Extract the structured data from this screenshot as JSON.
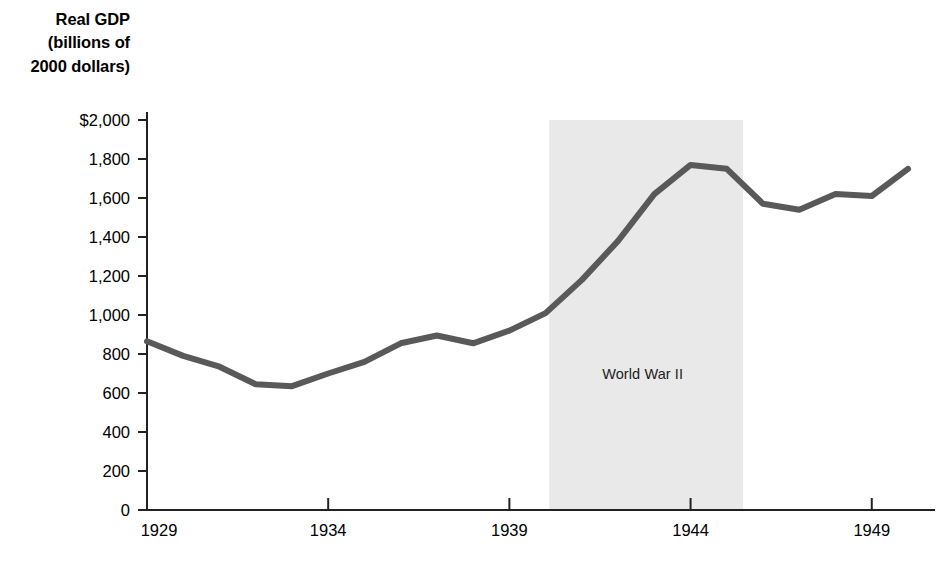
{
  "chart_data": {
    "type": "line",
    "title": "Real GDP\n(billions of\n2000 dollars)",
    "title_lines": [
      "Real GDP",
      "(billions of",
      "2000 dollars)"
    ],
    "xlabel": "",
    "ylabel": "Real GDP (billions of 2000 dollars)",
    "xlim": [
      1929,
      1950
    ],
    "ylim": [
      0,
      2000
    ],
    "grid": false,
    "legend": "none",
    "line_color": "#595959",
    "shaded_region": {
      "label": "World War II",
      "start": 1940.1,
      "end": 1945.45,
      "color": "#e9e9e9"
    },
    "y_ticks": [
      {
        "value": 2000,
        "label": "$2,000"
      },
      {
        "value": 1800,
        "label": "1,800"
      },
      {
        "value": 1600,
        "label": "1,600"
      },
      {
        "value": 1400,
        "label": "1,400"
      },
      {
        "value": 1200,
        "label": "1,200"
      },
      {
        "value": 1000,
        "label": "1,000"
      },
      {
        "value": 800,
        "label": "800"
      },
      {
        "value": 600,
        "label": "600"
      },
      {
        "value": 400,
        "label": "400"
      },
      {
        "value": 200,
        "label": "200"
      },
      {
        "value": 0,
        "label": "0"
      }
    ],
    "x_ticks": [
      {
        "value": 1929,
        "label": "1929"
      },
      {
        "value": 1934,
        "label": "1934"
      },
      {
        "value": 1939,
        "label": "1939"
      },
      {
        "value": 1944,
        "label": "1944"
      },
      {
        "value": 1949,
        "label": "1949"
      }
    ],
    "x": [
      1929,
      1930,
      1931,
      1932,
      1933,
      1934,
      1935,
      1936,
      1937,
      1938,
      1939,
      1940,
      1941,
      1942,
      1943,
      1944,
      1945,
      1946,
      1947,
      1948,
      1949,
      1950
    ],
    "values": [
      865,
      790,
      735,
      645,
      635,
      700,
      760,
      855,
      895,
      855,
      920,
      1010,
      1180,
      1380,
      1620,
      1770,
      1750,
      1570,
      1540,
      1620,
      1610,
      1750
    ],
    "series": [
      {
        "name": "Real GDP",
        "values": [
          865,
          790,
          735,
          645,
          635,
          700,
          760,
          855,
          895,
          855,
          920,
          1010,
          1180,
          1380,
          1620,
          1770,
          1750,
          1570,
          1540,
          1620,
          1610,
          1750
        ]
      }
    ]
  },
  "plot_geometry": {
    "left": 147,
    "right": 908,
    "top": 120,
    "bottom": 510
  }
}
